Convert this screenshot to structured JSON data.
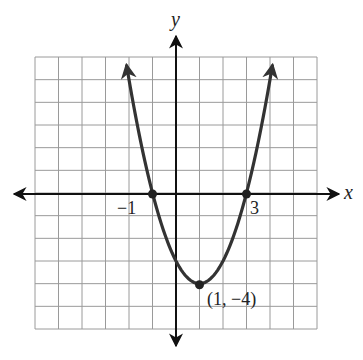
{
  "chart_data": {
    "type": "line",
    "title": "",
    "function": "y = (x - 1)^2 - 4",
    "xlabel": "x",
    "ylabel": "y",
    "xlim": [
      -6,
      6
    ],
    "ylim": [
      -6,
      6
    ],
    "grid": true,
    "grid_step": 1,
    "legend": null,
    "x": [
      -2.1,
      -1,
      0,
      1,
      2,
      3,
      4.1
    ],
    "values": [
      5.61,
      0,
      -3,
      -4,
      -3,
      0,
      5.61
    ],
    "annotations": [
      {
        "label": "-1",
        "x": -1,
        "y": 0,
        "point": true
      },
      {
        "label": "3",
        "x": 3,
        "y": 0,
        "point": true
      },
      {
        "label": "(1, -4)",
        "x": 1,
        "y": -4,
        "point": true
      }
    ]
  },
  "labels": {
    "x_axis": "x",
    "y_axis": "y",
    "root_left": "−1",
    "root_right": "3",
    "vertex": "(1, −4)"
  },
  "colors": {
    "grid": "#9a9a9a",
    "axis": "#111111",
    "curve": "#333333",
    "background": "#ffffff"
  }
}
